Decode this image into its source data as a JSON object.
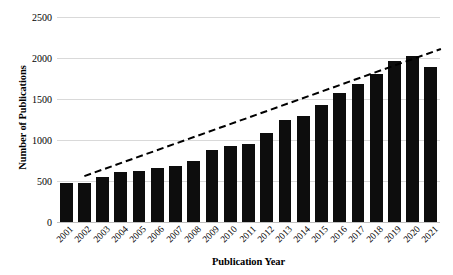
{
  "chart_data": {
    "type": "bar",
    "title": "",
    "xlabel": "Publication Year",
    "ylabel": "Number of Publications",
    "categories": [
      "2001",
      "2002",
      "2003",
      "2004",
      "2005",
      "2006",
      "2007",
      "2008",
      "2009",
      "2010",
      "2011",
      "2012",
      "2013",
      "2014",
      "2015",
      "2016",
      "2017",
      "2018",
      "2019",
      "2020",
      "2021"
    ],
    "values": [
      470,
      475,
      550,
      610,
      620,
      660,
      680,
      740,
      880,
      930,
      950,
      1090,
      1240,
      1290,
      1430,
      1570,
      1680,
      1800,
      1960,
      2030,
      1890
    ],
    "series": [
      {
        "name": "Number of Publications",
        "values": [
          470,
          475,
          550,
          610,
          620,
          660,
          680,
          740,
          880,
          930,
          950,
          1090,
          1240,
          1290,
          1430,
          1570,
          1680,
          1800,
          1960,
          2030,
          1890
        ]
      }
    ],
    "ylim": [
      0,
      2500
    ],
    "yticks": [
      0,
      500,
      1000,
      1500,
      2000,
      2500
    ],
    "ytick_labels": [
      "0",
      "500",
      "1000",
      "1500",
      "2000",
      "2500"
    ],
    "grid": true,
    "legend": false,
    "legend_position": "none",
    "bar_color": "#0d0d0d",
    "gridline_color": "#d9d9d9",
    "trendline": {
      "style": "dashed",
      "color": "#000000",
      "x_start": "2002",
      "x_end": "2021",
      "y_start": 560,
      "y_end": 2110
    }
  }
}
